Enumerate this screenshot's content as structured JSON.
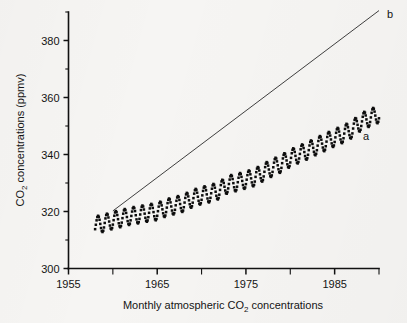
{
  "figure": {
    "caption": "Monthly atmospheric CO2 concentrations",
    "caption_parts": {
      "pre": "Monthly atmospheric CO",
      "sub": "2",
      "post": " concentrations"
    }
  },
  "axes": {
    "y_title_parts": {
      "pre": "CO",
      "sub": "2",
      "post": " concentrations (ppmv)"
    },
    "y_title": "CO2 concentrations (ppmv)",
    "x_title": "",
    "y_major_labels": [
      "300",
      "320",
      "340",
      "360",
      "380"
    ],
    "x_major_labels": [
      "1955",
      "1965",
      "1975",
      "1985"
    ]
  },
  "series_labels": {
    "a": "a",
    "b": "b"
  },
  "colors": {
    "ink": "#111111",
    "paper": "#f6f5f3",
    "line": "#2a2a2a"
  },
  "chart_data": {
    "type": "scatter",
    "title": "",
    "xlabel": "Monthly atmospheric CO2 concentrations",
    "ylabel": "CO2 concentrations (ppmv)",
    "xlim": [
      1955,
      1990
    ],
    "ylim": [
      300,
      390
    ],
    "y_ticks_major": [
      300,
      320,
      340,
      360,
      380
    ],
    "y_ticks_minor": [
      310,
      330,
      350,
      370,
      390
    ],
    "x_ticks_major": [
      1955,
      1965,
      1975,
      1985
    ],
    "x_ticks_minor": [
      1960,
      1970,
      1980,
      1990
    ],
    "grid": false,
    "legend": "inline-labels",
    "annotations": [
      {
        "text": "a",
        "x": 1989.2,
        "y": 344.5,
        "note": "monthly observed CO2 scatter series"
      },
      {
        "text": "b",
        "x": 1989.6,
        "y": 391.0,
        "note": "upper straight projection line"
      }
    ],
    "series": [
      {
        "name": "a",
        "type": "scatter",
        "marker": "square",
        "description": "Monthly mean atmospheric CO2 (Mauna Loa style Keeling curve) with seasonal sawtooth",
        "annual_mean": {
          "x": [
            1958,
            1959,
            1960,
            1961,
            1962,
            1963,
            1964,
            1965,
            1966,
            1967,
            1968,
            1969,
            1970,
            1971,
            1972,
            1973,
            1974,
            1975,
            1976,
            1977,
            1978,
            1979,
            1980,
            1981,
            1982,
            1983,
            1984,
            1985,
            1986,
            1987,
            1988,
            1989,
            1990
          ],
          "y": [
            315.3,
            315.9,
            316.9,
            317.6,
            318.4,
            318.9,
            319.5,
            320.0,
            321.3,
            322.1,
            323.0,
            324.6,
            325.6,
            326.3,
            327.4,
            329.6,
            330.2,
            331.1,
            332.0,
            333.8,
            335.4,
            336.8,
            338.7,
            340.1,
            341.4,
            343.0,
            344.4,
            345.9,
            347.2,
            348.9,
            351.5,
            352.9,
            354.2
          ]
        },
        "seasonal_amplitude_ppmv": 6.0,
        "seasonal_peak_month": 5,
        "points_per_year": 12,
        "y_start": 315.3,
        "y_end": 354.2
      },
      {
        "name": "b",
        "type": "line",
        "description": "Straight reference / projection line rising steeply above the observed data",
        "x": [
          1960.0,
          1990.0
        ],
        "y": [
          320.2,
          390.5
        ]
      }
    ]
  }
}
